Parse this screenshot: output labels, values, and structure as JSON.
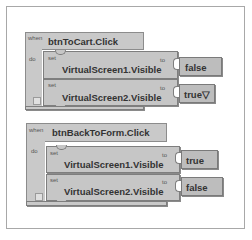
{
  "blocks": [
    {
      "when_label": "when",
      "event": "btnToCart.Click",
      "do_label": "do",
      "statements": [
        {
          "set_label": "set",
          "property": "VirtualScreen1.Visible",
          "to_label": "to",
          "value": "false"
        },
        {
          "set_label": "set",
          "property": "VirtualScreen2.Visible",
          "to_label": "to",
          "value": "true▽"
        }
      ]
    },
    {
      "when_label": "when",
      "event": "btnBackToForm.Click",
      "do_label": "do",
      "statements": [
        {
          "set_label": "set",
          "property": "VirtualScreen1.Visible",
          "to_label": "to",
          "value": "true"
        },
        {
          "set_label": "set",
          "property": "VirtualScreen2.Visible",
          "to_label": "to",
          "value": "false"
        }
      ]
    }
  ]
}
